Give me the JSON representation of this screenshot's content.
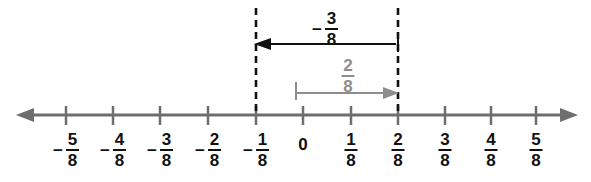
{
  "figure": {
    "type": "number-line",
    "axis": {
      "left_arrow": "left-arrowhead",
      "right_arrow": "right-arrowhead",
      "color": "#6e6e6e"
    },
    "ticks": [
      {
        "label_sign": "−",
        "numerator": "5",
        "denominator": "8",
        "value": -0.625,
        "x": 66
      },
      {
        "label_sign": "−",
        "numerator": "4",
        "denominator": "8",
        "value": -0.5,
        "x": 113
      },
      {
        "label_sign": "−",
        "numerator": "3",
        "denominator": "8",
        "value": -0.375,
        "x": 160
      },
      {
        "label_sign": "−",
        "numerator": "2",
        "denominator": "8",
        "value": -0.25,
        "x": 208
      },
      {
        "label_sign": "−",
        "numerator": "1",
        "denominator": "8",
        "value": -0.125,
        "x": 256
      },
      {
        "label_sign": "",
        "whole": "0",
        "value": 0,
        "x": 303
      },
      {
        "label_sign": "",
        "numerator": "1",
        "denominator": "8",
        "value": 0.125,
        "x": 351
      },
      {
        "label_sign": "",
        "numerator": "2",
        "denominator": "8",
        "value": 0.25,
        "x": 398
      },
      {
        "label_sign": "",
        "numerator": "3",
        "denominator": "8",
        "value": 0.375,
        "x": 445
      },
      {
        "label_sign": "",
        "numerator": "4",
        "denominator": "8",
        "value": 0.5,
        "x": 491
      },
      {
        "label_sign": "",
        "numerator": "5",
        "denominator": "8",
        "value": 0.625,
        "x": 536
      }
    ],
    "guide_lines": [
      {
        "name": "guide-line-at-minus-one-eighth",
        "x": 256,
        "value": -0.125
      },
      {
        "name": "guide-line-at-two-eighths",
        "x": 398,
        "value": 0.25
      }
    ],
    "jumps": [
      {
        "name": "negative-jump",
        "sign": "−",
        "numerator": "3",
        "denominator": "8",
        "value": -0.375,
        "direction": "left",
        "from_x": 398,
        "to_x": 256,
        "from_value": 0.25,
        "to_value": -0.125,
        "color": "#111111",
        "label_x": 325,
        "label_y": 10
      },
      {
        "name": "positive-jump",
        "sign": "",
        "numerator": "2",
        "denominator": "8",
        "value": 0.25,
        "direction": "right",
        "from_x": 295,
        "to_x": 398,
        "from_value": 0,
        "to_value": 0.25,
        "color": "#8d8d8d",
        "label_x": 348,
        "label_y": 57
      }
    ]
  }
}
